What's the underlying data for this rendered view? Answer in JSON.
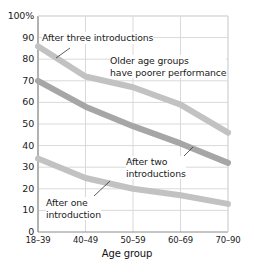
{
  "chart_data": {
    "type": "line",
    "title": "",
    "xlabel": "Age group",
    "ylabel": "",
    "categories": [
      "18–39",
      "40–49",
      "50–59",
      "60–69",
      "70–90"
    ],
    "ylim": [
      0,
      100
    ],
    "yticks": [
      "0",
      "10",
      "20",
      "30",
      "40",
      "50",
      "60",
      "70",
      "80",
      "90",
      "100%"
    ],
    "ytick_values": [
      0,
      10,
      20,
      30,
      40,
      50,
      60,
      70,
      80,
      90,
      100
    ],
    "grid": true,
    "legend_position": "none",
    "series": [
      {
        "name": "After three introductions",
        "values": [
          86,
          72,
          67,
          59,
          46
        ],
        "color": "#c2c2c2"
      },
      {
        "name": "After two introductions",
        "values": [
          70,
          58,
          49,
          41,
          32
        ],
        "color": "#a6a6a6"
      },
      {
        "name": "After one introduction",
        "values": [
          34,
          25,
          20,
          17,
          13
        ],
        "color": "#c2c2c2"
      }
    ],
    "annotations": [
      {
        "id": "after-three",
        "text": "After three introductions",
        "x_px": 42,
        "y_px": 32,
        "leader": {
          "x1": 70,
          "y1": 48,
          "x2": 56,
          "y2": 58
        }
      },
      {
        "id": "older-age-groups",
        "text": "Older age groups\nhave poorer performance",
        "x_px": 110,
        "y_px": 55,
        "leader": null
      },
      {
        "id": "after-two",
        "text": "After two\nintroductions",
        "x_px": 126,
        "y_px": 156,
        "leader": {
          "x1": 180,
          "y1": 160,
          "x2": 193,
          "y2": 147
        }
      },
      {
        "id": "after-one",
        "text": "After one\nintroduction",
        "x_px": 46,
        "y_px": 197,
        "leader": {
          "x1": 94,
          "y1": 196,
          "x2": 110,
          "y2": 181
        }
      }
    ],
    "colors": {
      "grid": "#d9d9d9",
      "axis": "#999999",
      "text": "#1a1a1a",
      "background": "#ffffff"
    }
  }
}
